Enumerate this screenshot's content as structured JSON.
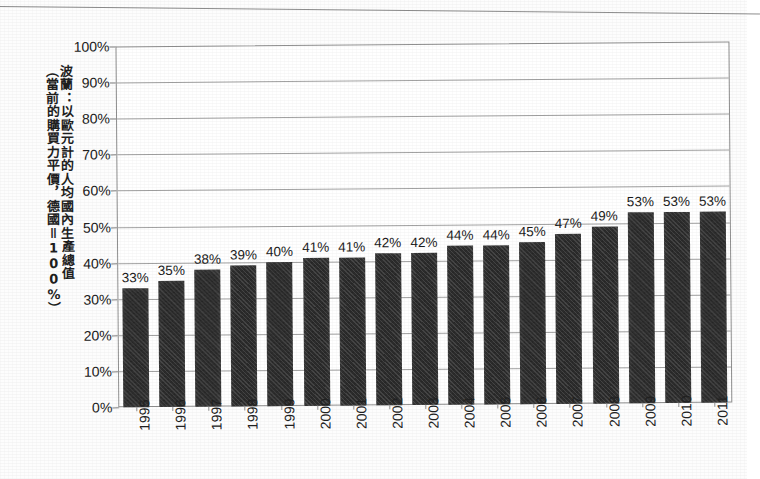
{
  "figure": {
    "background_color": "#ffffff",
    "frame_color": "#8f8f8f",
    "gridline_color": "#a2a2a2",
    "bar_color": "#2c2c2c",
    "axis_title_lines": [
      "波蘭：以歐元計的人均國內生產總值",
      "（當前的購買力平價，德國＝100%）"
    ]
  },
  "chart_data": {
    "type": "bar",
    "title": "",
    "subtitle": "",
    "xlabel": "",
    "ylabel": "波蘭：以歐元計的人均國內生產總值（當前的購買力平價，德國＝100%）",
    "categories": [
      "1995",
      "1996",
      "1997",
      "1998",
      "1999",
      "2000",
      "2001",
      "2002",
      "2003",
      "2004",
      "2005",
      "2006",
      "2007",
      "2008",
      "2009",
      "2010",
      "2011"
    ],
    "values": [
      33,
      35,
      38,
      39,
      40,
      41,
      41,
      42,
      42,
      44,
      44,
      45,
      47,
      49,
      53,
      53,
      53
    ],
    "value_labels": [
      "33%",
      "35%",
      "38%",
      "39%",
      "40%",
      "41%",
      "41%",
      "42%",
      "42%",
      "44%",
      "44%",
      "45%",
      "47%",
      "49%",
      "53%",
      "53%",
      "53%"
    ],
    "ylim": [
      0,
      100
    ],
    "ytick_values": [
      0,
      10,
      20,
      30,
      40,
      50,
      60,
      70,
      80,
      90,
      100
    ],
    "ytick_labels": [
      "0%",
      "10%",
      "20%",
      "30%",
      "40%",
      "50%",
      "60%",
      "70%",
      "80%",
      "90%",
      "100%"
    ],
    "unit": "%",
    "grid": true,
    "legend": false,
    "legend_position": "none",
    "orientation": "vertical",
    "data_labels_shown": true
  }
}
